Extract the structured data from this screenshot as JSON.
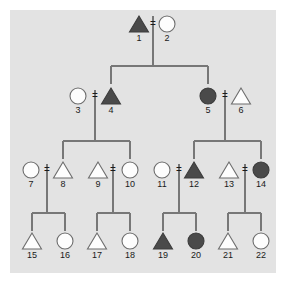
{
  "figure": {
    "background_color": "#e3e3e3",
    "line_color": "#777777",
    "open_symbol_color": "#fdfdfd",
    "filled_symbol_color": "#4a4a4a",
    "label_color": "#1a1a1a",
    "mating_symbol": "=",
    "generations": 4,
    "individual_count": 22
  },
  "chart_data": {
    "type": "diagram",
    "diagram_kind": "pedigree",
    "legend": {
      "triangle": "male",
      "circle": "female",
      "filled": "affected",
      "open": "unaffected"
    },
    "generation_rows": [
      {
        "generation": 1,
        "y": 24,
        "members": [
          1,
          2
        ]
      },
      {
        "generation": 2,
        "y": 96,
        "members": [
          3,
          4,
          5,
          6
        ]
      },
      {
        "generation": 3,
        "y": 170,
        "members": [
          7,
          8,
          9,
          10,
          11,
          12,
          13,
          14
        ]
      },
      {
        "generation": 4,
        "y": 241,
        "members": [
          15,
          16,
          17,
          18,
          19,
          20,
          21,
          22
        ]
      }
    ],
    "individuals": [
      {
        "id": 1,
        "label": "1",
        "shape": "triangle",
        "status": "filled",
        "cx": 139,
        "cy": 24,
        "generation": 1
      },
      {
        "id": 2,
        "label": "2",
        "shape": "circle",
        "status": "open",
        "cx": 167,
        "cy": 24,
        "generation": 1
      },
      {
        "id": 3,
        "label": "3",
        "shape": "circle",
        "status": "open",
        "cx": 78,
        "cy": 96,
        "generation": 2
      },
      {
        "id": 4,
        "label": "4",
        "shape": "triangle",
        "status": "filled",
        "cx": 111,
        "cy": 96,
        "generation": 2
      },
      {
        "id": 5,
        "label": "5",
        "shape": "circle",
        "status": "filled",
        "cx": 208,
        "cy": 96,
        "generation": 2
      },
      {
        "id": 6,
        "label": "6",
        "shape": "triangle",
        "status": "open",
        "cx": 241,
        "cy": 96,
        "generation": 2
      },
      {
        "id": 7,
        "label": "7",
        "shape": "circle",
        "status": "open",
        "cx": 31,
        "cy": 170,
        "generation": 3
      },
      {
        "id": 8,
        "label": "8",
        "shape": "triangle",
        "status": "open",
        "cx": 63,
        "cy": 170,
        "generation": 3
      },
      {
        "id": 9,
        "label": "9",
        "shape": "triangle",
        "status": "open",
        "cx": 98,
        "cy": 170,
        "generation": 3
      },
      {
        "id": 10,
        "label": "10",
        "shape": "circle",
        "status": "open",
        "cx": 130,
        "cy": 170,
        "generation": 3
      },
      {
        "id": 11,
        "label": "11",
        "shape": "circle",
        "status": "open",
        "cx": 162,
        "cy": 170,
        "generation": 3
      },
      {
        "id": 12,
        "label": "12",
        "shape": "triangle",
        "status": "filled",
        "cx": 194,
        "cy": 170,
        "generation": 3
      },
      {
        "id": 13,
        "label": "13",
        "shape": "triangle",
        "status": "open",
        "cx": 229,
        "cy": 170,
        "generation": 3
      },
      {
        "id": 14,
        "label": "14",
        "shape": "circle",
        "status": "filled",
        "cx": 261,
        "cy": 170,
        "generation": 3
      },
      {
        "id": 15,
        "label": "15",
        "shape": "triangle",
        "status": "open",
        "cx": 32,
        "cy": 241,
        "generation": 4
      },
      {
        "id": 16,
        "label": "16",
        "shape": "circle",
        "status": "open",
        "cx": 65,
        "cy": 241,
        "generation": 4
      },
      {
        "id": 17,
        "label": "17",
        "shape": "triangle",
        "status": "open",
        "cx": 97,
        "cy": 241,
        "generation": 4
      },
      {
        "id": 18,
        "label": "18",
        "shape": "circle",
        "status": "open",
        "cx": 130,
        "cy": 241,
        "generation": 4
      },
      {
        "id": 19,
        "label": "19",
        "shape": "triangle",
        "status": "filled",
        "cx": 163,
        "cy": 241,
        "generation": 4
      },
      {
        "id": 20,
        "label": "20",
        "shape": "circle",
        "status": "filled",
        "cx": 196,
        "cy": 241,
        "generation": 4
      },
      {
        "id": 21,
        "label": "21",
        "shape": "triangle",
        "status": "open",
        "cx": 228,
        "cy": 241,
        "generation": 4
      },
      {
        "id": 22,
        "label": "22",
        "shape": "circle",
        "status": "open",
        "cx": 261,
        "cy": 241,
        "generation": 4
      }
    ],
    "matings": [
      {
        "partners": [
          1,
          2
        ],
        "children": [
          4,
          5
        ]
      },
      {
        "partners": [
          3,
          4
        ],
        "children": [
          8,
          9
        ]
      },
      {
        "partners": [
          5,
          6
        ],
        "children": [
          12,
          13
        ]
      },
      {
        "partners": [
          7,
          8
        ],
        "children": [
          15,
          16
        ]
      },
      {
        "partners": [
          9,
          10
        ],
        "children": [
          17,
          18
        ]
      },
      {
        "partners": [
          11,
          12
        ],
        "children": [
          19,
          20
        ]
      },
      {
        "partners": [
          13,
          14
        ],
        "children": [
          21,
          22
        ]
      }
    ]
  }
}
